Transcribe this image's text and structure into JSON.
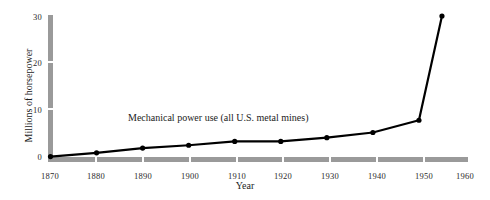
{
  "chart_data": {
    "type": "line",
    "title": "",
    "subtitle": "",
    "xlabel": "Year",
    "ylabel": "Millions of horsepower",
    "xlim": [
      1870,
      1960
    ],
    "ylim": [
      0,
      30
    ],
    "grid": false,
    "legend": "none",
    "annotations": [
      {
        "text": "Mechanical power use (all U.S. metal mines)",
        "x": 1900,
        "y": 12.5
      }
    ],
    "xticks": [
      1870,
      1880,
      1890,
      1900,
      1910,
      1920,
      1930,
      1940,
      1950,
      1960
    ],
    "xtick_labels": [
      "1870",
      "1880",
      "1890",
      "1900",
      "1910",
      "1920",
      "1930",
      "1940",
      "1950",
      "1960"
    ],
    "yticks": [
      0,
      10,
      20,
      30
    ],
    "ytick_labels": [
      "0",
      "10",
      "20",
      "30"
    ],
    "series": [
      {
        "name": "Mechanical power use (all U.S. metal mines)",
        "x": [
          1870,
          1880,
          1890,
          1900,
          1910,
          1920,
          1930,
          1940,
          1950,
          1955
        ],
        "values": [
          0.2,
          1.0,
          2.0,
          2.6,
          3.4,
          3.4,
          4.2,
          5.3,
          7.9,
          30.0
        ],
        "marker": "circle",
        "color": "#000000"
      }
    ]
  },
  "style": {
    "axis_color": "#9a9a9a",
    "line_color": "#000000",
    "text_color": "#1c1c1c",
    "background": "#ffffff"
  }
}
